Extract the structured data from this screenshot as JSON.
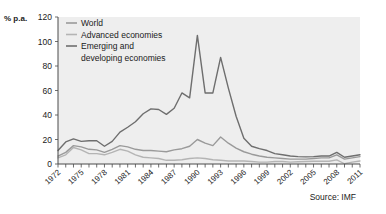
{
  "chart_data": {
    "type": "line",
    "title": "",
    "ylabel": "% p.a.",
    "xlabel": "",
    "source": "Source: IMF",
    "ylim": [
      0,
      120
    ],
    "yticks": [
      0,
      20,
      40,
      60,
      80,
      100,
      120
    ],
    "xlim": [
      1972,
      2011
    ],
    "xticks_labeled": [
      1972,
      1975,
      1978,
      1981,
      1984,
      1987,
      1990,
      1993,
      1996,
      1999,
      2002,
      2005,
      2008,
      2011
    ],
    "grid": false,
    "legend_position": "top-left",
    "x": [
      1972,
      1973,
      1974,
      1975,
      1976,
      1977,
      1978,
      1979,
      1980,
      1981,
      1982,
      1983,
      1984,
      1985,
      1986,
      1987,
      1988,
      1989,
      1990,
      1991,
      1992,
      1993,
      1994,
      1995,
      1996,
      1997,
      1998,
      1999,
      2000,
      2001,
      2002,
      2003,
      2004,
      2005,
      2006,
      2007,
      2008,
      2009,
      2010,
      2011
    ],
    "series": [
      {
        "name": "World",
        "color": "#9a9a9a",
        "values": [
          6.5,
          9.5,
          15.0,
          14.0,
          12.0,
          11.5,
          9.5,
          12.0,
          15.0,
          14.0,
          12.0,
          11.0,
          11.0,
          10.5,
          10.0,
          11.5,
          12.5,
          14.5,
          20.0,
          17.0,
          15.0,
          22.0,
          17.0,
          13.0,
          10.0,
          8.0,
          6.5,
          5.5,
          5.0,
          4.5,
          4.0,
          4.0,
          4.0,
          4.5,
          5.0,
          5.0,
          7.5,
          4.0,
          5.0,
          6.0
        ]
      },
      {
        "name": "Advanced economies",
        "color": "#b4b4b4",
        "values": [
          5.0,
          7.5,
          13.5,
          11.5,
          8.5,
          8.5,
          7.5,
          9.5,
          12.0,
          10.5,
          7.5,
          5.5,
          5.0,
          4.5,
          3.0,
          3.0,
          3.5,
          4.5,
          5.0,
          4.5,
          3.5,
          3.0,
          2.5,
          2.5,
          2.5,
          2.0,
          1.5,
          1.5,
          2.0,
          2.0,
          1.5,
          1.8,
          2.0,
          2.3,
          2.3,
          2.2,
          3.4,
          0.2,
          1.5,
          2.5
        ]
      },
      {
        "name": "Emerging and developing economies",
        "color": "#6e6e6e",
        "values": [
          11.0,
          18.0,
          20.5,
          18.5,
          19.0,
          19.0,
          14.5,
          18.5,
          26.0,
          30.0,
          34.5,
          41.0,
          45.0,
          44.5,
          40.5,
          45.5,
          58.0,
          54.0,
          105.0,
          58.0,
          58.0,
          87.0,
          62.0,
          39.0,
          21.0,
          14.5,
          12.5,
          11.0,
          8.5,
          7.5,
          6.5,
          6.0,
          5.8,
          6.0,
          6.5,
          6.5,
          9.5,
          5.5,
          6.5,
          7.5
        ]
      }
    ],
    "legend_entries": [
      {
        "label": "World",
        "color": "#9a9a9a"
      },
      {
        "label": "Advanced economies",
        "color": "#b4b4b4"
      },
      {
        "label": "Emerging and",
        "color": "#6e6e6e"
      },
      {
        "label": "developing economies",
        "color": null
      }
    ]
  }
}
